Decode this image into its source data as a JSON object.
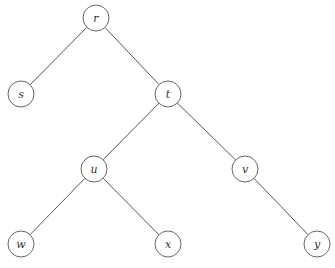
{
  "diagram": {
    "type": "binary-tree",
    "root": "r",
    "node_radius": 13,
    "colors": {
      "background": "#ffffff",
      "edge": "#555555",
      "node_stroke": "#666666",
      "label": "#333333"
    },
    "nodes": [
      {
        "id": "r",
        "label": "r",
        "x": 96,
        "y": 18
      },
      {
        "id": "s",
        "label": "s",
        "x": 21,
        "y": 94
      },
      {
        "id": "t",
        "label": "t",
        "x": 168,
        "y": 94
      },
      {
        "id": "u",
        "label": "u",
        "x": 94,
        "y": 169
      },
      {
        "id": "v",
        "label": "v",
        "x": 245,
        "y": 169
      },
      {
        "id": "w",
        "label": "w",
        "x": 21,
        "y": 244
      },
      {
        "id": "x",
        "label": "x",
        "x": 168,
        "y": 244
      },
      {
        "id": "y",
        "label": "y",
        "x": 317,
        "y": 244
      }
    ],
    "edges": [
      {
        "from": "r",
        "to": "s"
      },
      {
        "from": "r",
        "to": "t"
      },
      {
        "from": "t",
        "to": "u"
      },
      {
        "from": "t",
        "to": "v"
      },
      {
        "from": "u",
        "to": "w"
      },
      {
        "from": "u",
        "to": "x"
      },
      {
        "from": "v",
        "to": "y"
      }
    ]
  }
}
